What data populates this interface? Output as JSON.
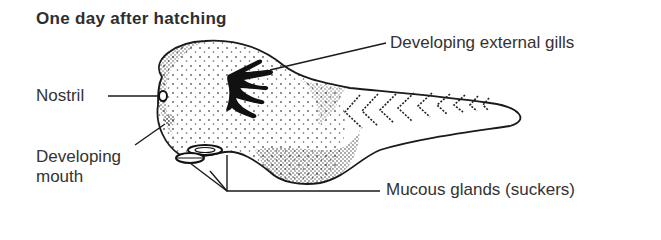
{
  "figure": {
    "title": "One day after hatching",
    "labels": {
      "gills": "Developing external gills",
      "nostril": "Nostril",
      "mouth": "Developing mouth",
      "mucous": "Mucous glands (suckers)"
    },
    "colors": {
      "ink": "#1a1a1a",
      "text": "#333333",
      "background": "#ffffff"
    }
  }
}
